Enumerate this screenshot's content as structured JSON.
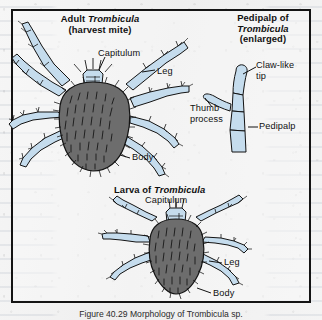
{
  "figure": {
    "caption": "Figure 40.29 Morphology of Trombicula sp.",
    "frame_color": "#141414",
    "paper_color": "#f1f1f1"
  },
  "colors": {
    "body_fill": "#6d6d6d",
    "body_fill_light": "#7b7b7b",
    "leg_fill": "#c5dced",
    "leg_fill_light": "#dceaf6",
    "outline": "#131313",
    "hair": "#111111"
  },
  "panels": {
    "adult": {
      "title_line1": "Adult Trombicula",
      "title_line1_plain": "Adult ",
      "title_line1_italic": "Trombicula",
      "title_line2": "(harvest mite)",
      "labels": {
        "capitulum": "Capitulum",
        "leg": "Leg",
        "body": "Body"
      }
    },
    "pedipalp": {
      "title_line1": "Pedipalp of",
      "title_line2_italic": "Trombicula",
      "title_line3": "(enlarged)",
      "labels": {
        "claw_like_tip_line1": "Claw-like",
        "claw_like_tip_line2": "tip",
        "thumb_process_line1": "Thumb",
        "thumb_process_line2": "process",
        "pedipalp": "Pedipalp"
      }
    },
    "larva": {
      "title_plain": "Larva of ",
      "title_italic": "Trombicula",
      "labels": {
        "capitulum": "Capitulum",
        "leg": "Leg",
        "body": "Body"
      }
    }
  }
}
